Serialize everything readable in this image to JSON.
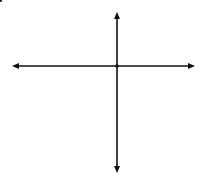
{
  "problem": {
    "label": "B."
  },
  "axes": {
    "x_label": "x",
    "y_label": "y",
    "origin_label": "O"
  },
  "grid": {
    "origin_px": [
      117,
      66
    ],
    "unit_px": 13.1,
    "x_range": [
      -7,
      5
    ],
    "y_range": [
      -7,
      4
    ],
    "line_color": "#c8c8c8"
  },
  "figures": {
    "preimage": {
      "color": "#1a1a1a",
      "vertices": [
        {
          "name": "M",
          "x": -6,
          "y": 0
        },
        {
          "name": "L",
          "x": -2,
          "y": 0
        },
        {
          "name": "K",
          "x": -3,
          "y": -3
        },
        {
          "name": "J",
          "x": -7,
          "y": -2
        }
      ]
    },
    "image": {
      "color": "#808080",
      "vertices": [
        {
          "name": "M'",
          "x": 0,
          "y": -6
        },
        {
          "name": "L'",
          "x": 0,
          "y": -2
        },
        {
          "name": "K'",
          "x": 3,
          "y": -3
        },
        {
          "name": "J'",
          "x": 2,
          "y": -7
        }
      ]
    }
  },
  "rotation": {
    "point": {
      "name": "X",
      "x": -3,
      "y": -4
    },
    "image_point": {
      "name": "X'",
      "x": 4,
      "y": -3
    },
    "center": "O",
    "direction": "counterclockwise",
    "angle_deg": 90
  }
}
